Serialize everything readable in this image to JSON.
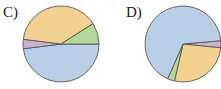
{
  "chart_data": [
    {
      "type": "pie",
      "title": "C)",
      "slices": [
        {
          "name": "blue",
          "value": 48,
          "color": "#b8cfe6"
        },
        {
          "name": "purple",
          "value": 4,
          "color": "#c9b3cf"
        },
        {
          "name": "orange",
          "value": 39,
          "color": "#f2d08f"
        },
        {
          "name": "green",
          "value": 9,
          "color": "#b3d89c"
        }
      ],
      "start_angle_deg": 0,
      "direction": "clockwise-from-east",
      "center": [
        61,
        44
      ],
      "radius": 38
    },
    {
      "type": "pie",
      "title": "D)",
      "slices": [
        {
          "name": "purple",
          "value": 3,
          "color": "#c9b3cf"
        },
        {
          "name": "orange",
          "value": 27,
          "color": "#f2d08f"
        },
        {
          "name": "green",
          "value": 3,
          "color": "#b3d89c"
        },
        {
          "name": "blue",
          "value": 67,
          "color": "#b8cfe6"
        }
      ],
      "start_angle_deg": -5,
      "direction": "clockwise-from-east",
      "center": [
        183,
        44
      ],
      "radius": 38
    }
  ],
  "labels": {
    "c": "C)",
    "d": "D)"
  }
}
